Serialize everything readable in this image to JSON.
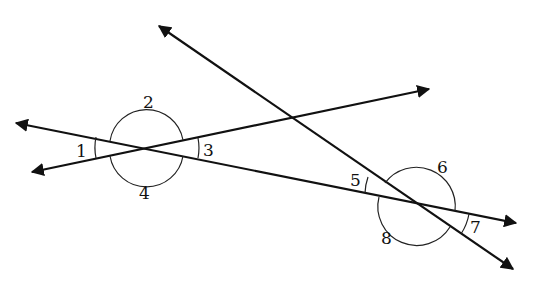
{
  "diagram": {
    "type": "intersecting-lines-angles",
    "lines": [
      {
        "id": "line-a",
        "from": [
          11,
          122
        ],
        "to": [
          521,
          224
        ],
        "arrows": "both"
      },
      {
        "id": "line-b",
        "from": [
          27,
          173
        ],
        "to": [
          434,
          88
        ],
        "arrows": "both"
      },
      {
        "id": "line-c",
        "from": [
          155,
          23
        ],
        "to": [
          517,
          272
        ],
        "arrows": "both"
      }
    ],
    "intersections": [
      {
        "id": "left",
        "point": [
          147,
          148
        ],
        "angles": [
          "1",
          "2",
          "3",
          "4"
        ]
      },
      {
        "id": "right",
        "point": [
          418,
          204
        ],
        "angles": [
          "5",
          "6",
          "7",
          "8"
        ]
      }
    ],
    "labels": {
      "a1": "1",
      "a2": "2",
      "a3": "3",
      "a4": "4",
      "a5": "5",
      "a6": "6",
      "a7": "7",
      "a8": "8"
    },
    "colors": {
      "stroke": "#111111",
      "background": "#ffffff"
    }
  }
}
